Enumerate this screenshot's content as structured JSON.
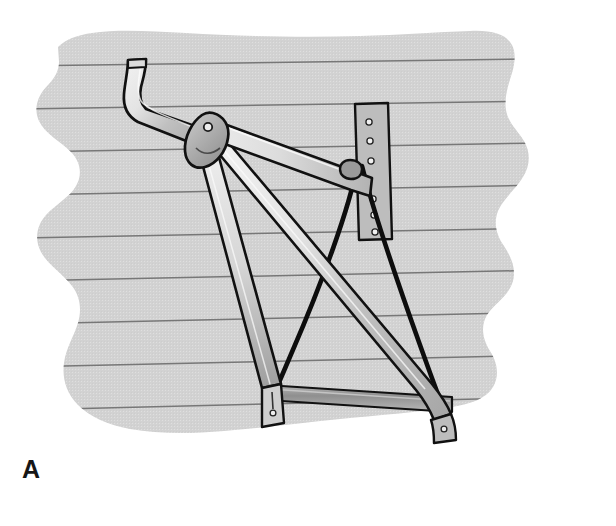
{
  "figure": {
    "panel_label": "A",
    "caption": "",
    "background_color": "#d2d2d2",
    "page_color": "#ffffff"
  },
  "colors": {
    "wall_fill": "#d2d2d2",
    "wall_line": "#6f6f6f",
    "metal_light": "#e9e9e9",
    "metal_mid": "#c4c4c4",
    "metal_dark": "#a9a9a9",
    "bracket_fill": "#bdbdbd",
    "outline": "#111111",
    "cable": "#0d0d0d",
    "rail_fill": "#9a9a9a",
    "label_color": "#161616"
  },
  "wall": {
    "name": "lap-siding wall panel",
    "torn_edge": true,
    "siding_course_count": 10,
    "siding_line_color": "#6f6f6f",
    "siding_spacing_px": 43
  },
  "parts": [
    {
      "id": "upper-arm",
      "name": "upper arm with hooked end",
      "note": "long tapered arm running from hooked tip at upper left down to the pivot hub"
    },
    {
      "id": "hook-tip",
      "name": "curved hook end of upper arm"
    },
    {
      "id": "pivot-hub",
      "name": "pivot hub with center rivet",
      "rivet_count": 1
    },
    {
      "id": "main-rafter-arm",
      "name": "main rafter arm to wall bracket"
    },
    {
      "id": "lower-strut-arm",
      "name": "long lower strut arm to right foot"
    },
    {
      "id": "left-leg-arm",
      "name": "left leg arm to base foot"
    },
    {
      "id": "wall-bracket",
      "name": "vertical wall mounting plate",
      "hole_count": 6
    },
    {
      "id": "cable-left",
      "name": "left tension cable"
    },
    {
      "id": "cable-right",
      "name": "right tension cable"
    },
    {
      "id": "bottom-rail",
      "name": "horizontal bottom rail"
    },
    {
      "id": "left-foot",
      "name": "left foot end cap with fastener hole"
    },
    {
      "id": "right-foot",
      "name": "right foot end cap with fastener hole"
    }
  ],
  "fasteners": {
    "bracket_hole_labels": [
      "hole-1",
      "hole-2",
      "hole-3",
      "hole-4",
      "hole-5",
      "hole-6"
    ],
    "pivot_rivet_label": "pivot-rivet",
    "left_foot_hole_label": "left-foot-hole",
    "right_foot_hole_label": "right-foot-hole"
  }
}
